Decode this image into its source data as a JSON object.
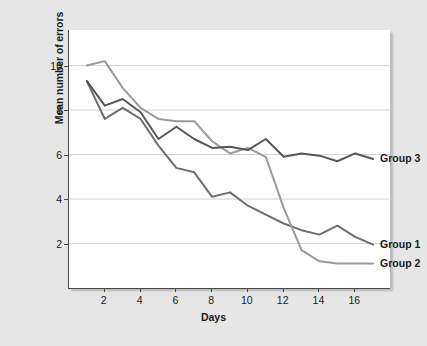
{
  "chart_data": {
    "type": "line",
    "title": "",
    "xlabel": "Days",
    "ylabel": "Mean number of errors",
    "xlim": [
      0,
      18
    ],
    "ylim": [
      0,
      11.6
    ],
    "xticks": [
      2,
      4,
      6,
      8,
      10,
      12,
      14,
      16
    ],
    "yticks": [
      2,
      4,
      6,
      8,
      10
    ],
    "grid": "horizontal",
    "legend_position": "right-inline",
    "x": [
      1,
      2,
      3,
      4,
      5,
      6,
      7,
      8,
      9,
      10,
      11,
      12,
      13,
      14,
      15,
      16,
      17
    ],
    "series": [
      {
        "name": "Group 1",
        "color": "#6e6e6e",
        "values": [
          9.3,
          7.6,
          8.1,
          7.6,
          6.4,
          5.4,
          5.2,
          4.1,
          4.3,
          3.7,
          3.3,
          2.9,
          2.6,
          2.4,
          2.8,
          2.3,
          1.95
        ]
      },
      {
        "name": "Group 2",
        "color": "#9a9a9a",
        "values": [
          10.0,
          10.2,
          9.0,
          8.1,
          7.6,
          7.5,
          7.5,
          6.6,
          6.05,
          6.3,
          5.9,
          3.6,
          1.7,
          1.2,
          1.1,
          1.1,
          1.1
        ]
      },
      {
        "name": "Group 3",
        "color": "#575757",
        "values": [
          9.3,
          8.2,
          8.5,
          7.9,
          6.7,
          7.25,
          6.7,
          6.3,
          6.35,
          6.2,
          6.7,
          5.9,
          6.05,
          5.95,
          5.7,
          6.05,
          5.8
        ]
      }
    ],
    "labels": {
      "group1": "Group 1",
      "group2": "Group 2",
      "group3": "Group 3"
    },
    "colors": {
      "background": "#e6e6e6",
      "panel": "#ffffff",
      "axis": "#4a4a4a",
      "gridline": "#d2d2d2",
      "text": "#1a1a1a"
    }
  }
}
